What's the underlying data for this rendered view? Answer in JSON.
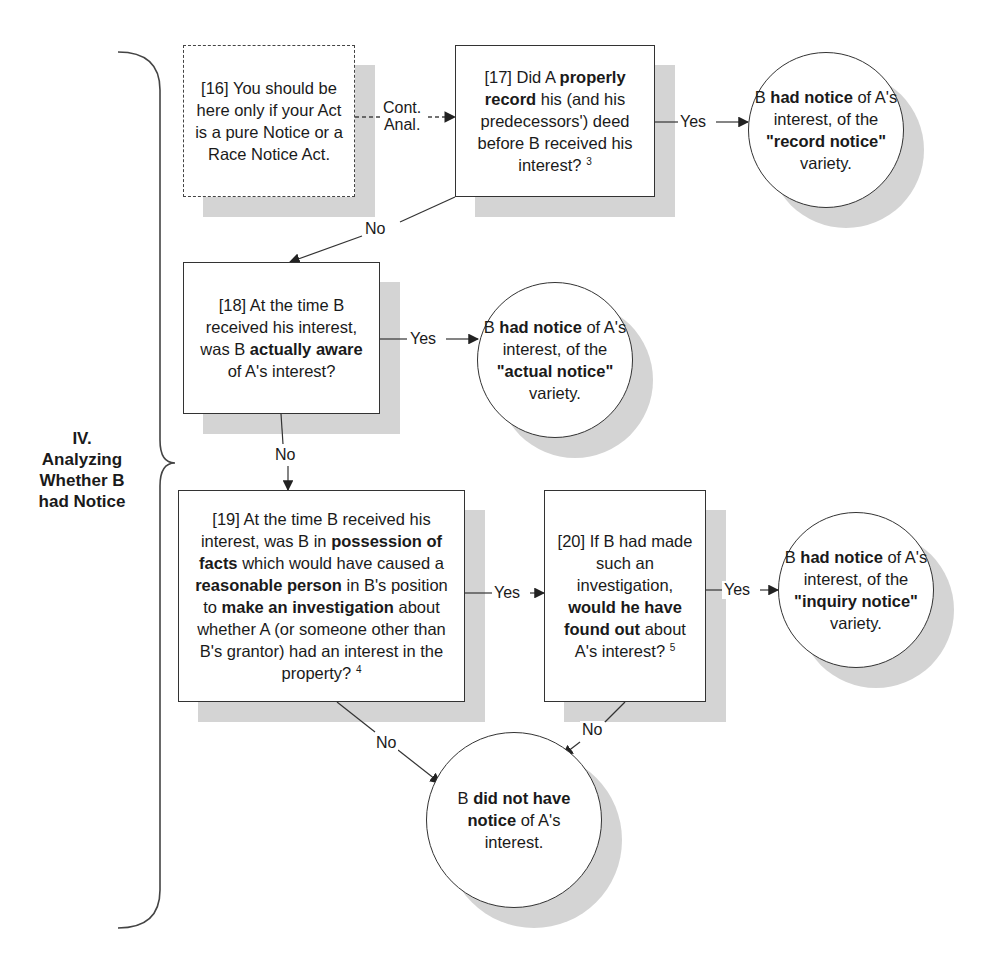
{
  "section": {
    "number": "IV.",
    "title_lines": [
      "Analyzing",
      "Whether B",
      "had Notice"
    ]
  },
  "nodes": {
    "n16": {
      "id": "[16]",
      "segments": [
        {
          "t": "[16] You should be here only if your Act is a pure Notice or a Race Notice Act.",
          "b": false
        }
      ],
      "style": "dashed"
    },
    "n17": {
      "id": "[17]",
      "segments": [
        {
          "t": "[17] Did A ",
          "b": false
        },
        {
          "t": "properly record",
          "b": true
        },
        {
          "t": " his (and his predecessors') deed before B received his interest?",
          "b": false
        }
      ],
      "footnote": "3"
    },
    "n18": {
      "id": "[18]",
      "segments": [
        {
          "t": "[18] At the time B received his interest, was B ",
          "b": false
        },
        {
          "t": "actually aware",
          "b": true
        },
        {
          "t": " of A's interest?",
          "b": false
        }
      ]
    },
    "n19": {
      "id": "[19]",
      "segments": [
        {
          "t": "[19] At the time B received his interest, was B in ",
          "b": false
        },
        {
          "t": "possession of facts",
          "b": true
        },
        {
          "t": " which would have caused a ",
          "b": false
        },
        {
          "t": "reasonable person",
          "b": true
        },
        {
          "t": " in B's position to ",
          "b": false
        },
        {
          "t": "make an investigation",
          "b": true
        },
        {
          "t": " about whether A (or someone other than B's grantor) had an interest in the property?",
          "b": false
        }
      ],
      "footnote": "4"
    },
    "n20": {
      "id": "[20]",
      "segments": [
        {
          "t": "[20] If B had made such an investigation, ",
          "b": false
        },
        {
          "t": "would he have found out",
          "b": true
        },
        {
          "t": " about A's interest?",
          "b": false
        }
      ],
      "footnote": "5"
    },
    "record": {
      "segments": [
        {
          "t": "B ",
          "b": false
        },
        {
          "t": "had notice",
          "b": true
        },
        {
          "t": " of A's interest, of the ",
          "b": false
        },
        {
          "t": "\"record notice\"",
          "b": true
        },
        {
          "t": " variety.",
          "b": false
        }
      ]
    },
    "actual": {
      "segments": [
        {
          "t": "B ",
          "b": false
        },
        {
          "t": "had notice",
          "b": true
        },
        {
          "t": " of A's interest, of the ",
          "b": false
        },
        {
          "t": "\"actual notice\"",
          "b": true
        },
        {
          "t": " variety.",
          "b": false
        }
      ]
    },
    "inquiry": {
      "segments": [
        {
          "t": "B ",
          "b": false
        },
        {
          "t": "had notice",
          "b": true
        },
        {
          "t": " of A's interest, of the ",
          "b": false
        },
        {
          "t": "\"inquiry notice\"",
          "b": true
        },
        {
          "t": " variety.",
          "b": false
        }
      ]
    },
    "none": {
      "segments": [
        {
          "t": "B ",
          "b": false
        },
        {
          "t": "did not have notice",
          "b": true
        },
        {
          "t": " of A's interest.",
          "b": false
        }
      ]
    }
  },
  "edges": {
    "cont": "Cont. Anal.",
    "cont_line1": "Cont.",
    "cont_line2": "Anal.",
    "e17_yes": "Yes",
    "e17_no": "No",
    "e18_yes": "Yes",
    "e18_no": "No",
    "e19_yes": "Yes",
    "e19_no": "No",
    "e20_yes": "Yes",
    "e20_no": "No"
  },
  "colors": {
    "line": "#333333",
    "shadow": "#d4d4d4",
    "background": "#ffffff"
  }
}
